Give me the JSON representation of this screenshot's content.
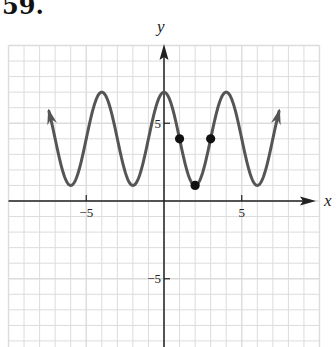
{
  "problem": {
    "number": "59."
  },
  "chart_data": {
    "type": "line",
    "title": "",
    "xlabel": "x",
    "ylabel": "y",
    "xlim": [
      -10,
      10
    ],
    "ylim": [
      -9.5,
      10
    ],
    "grid": true,
    "x_tick_labels": [
      {
        "value": -5,
        "label": "−5"
      },
      {
        "value": 5,
        "label": "5"
      }
    ],
    "y_tick_labels": [
      {
        "value": 5,
        "label": "5"
      },
      {
        "value": -5,
        "label": "−5"
      }
    ],
    "series": [
      {
        "name": "curve",
        "function": "y = 3cos(πx/2) + 4",
        "x_range": [
          -7.4,
          7.4
        ],
        "amplitude": 3,
        "midline": 4,
        "period": 4,
        "maxima": [
          [
            -4,
            7
          ],
          [
            0,
            7
          ],
          [
            4,
            7
          ]
        ],
        "minima": [
          [
            -6,
            1
          ],
          [
            -2,
            1
          ],
          [
            2,
            1
          ],
          [
            6,
            1
          ]
        ],
        "arrows_at_ends": true,
        "color": "#555555"
      }
    ],
    "points": [
      {
        "x": 1,
        "y": 4
      },
      {
        "x": 2,
        "y": 1
      },
      {
        "x": 3,
        "y": 4
      }
    ]
  },
  "colors": {
    "grid": "#dcdcdc",
    "axis": "#222222",
    "curve": "#555555",
    "point": "#111111"
  }
}
